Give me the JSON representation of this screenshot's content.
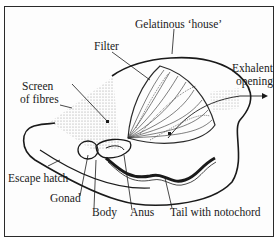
{
  "diagram": {
    "labels": {
      "house": "Gelatinous ‘house’",
      "filter": "Filter",
      "screen_line1": "Screen",
      "screen_line2": "of fibres",
      "exhalent_line1": "Exhalent",
      "exhalent_line2": "opening",
      "escape": "Escape hatch",
      "gonad": "Gonad",
      "body": "Body",
      "anus": "Anus",
      "tail": "Tail with notochord"
    },
    "colors": {
      "ink": "#1a1a1a",
      "stipple": "#9a9a9a",
      "background": "#ffffff"
    }
  }
}
